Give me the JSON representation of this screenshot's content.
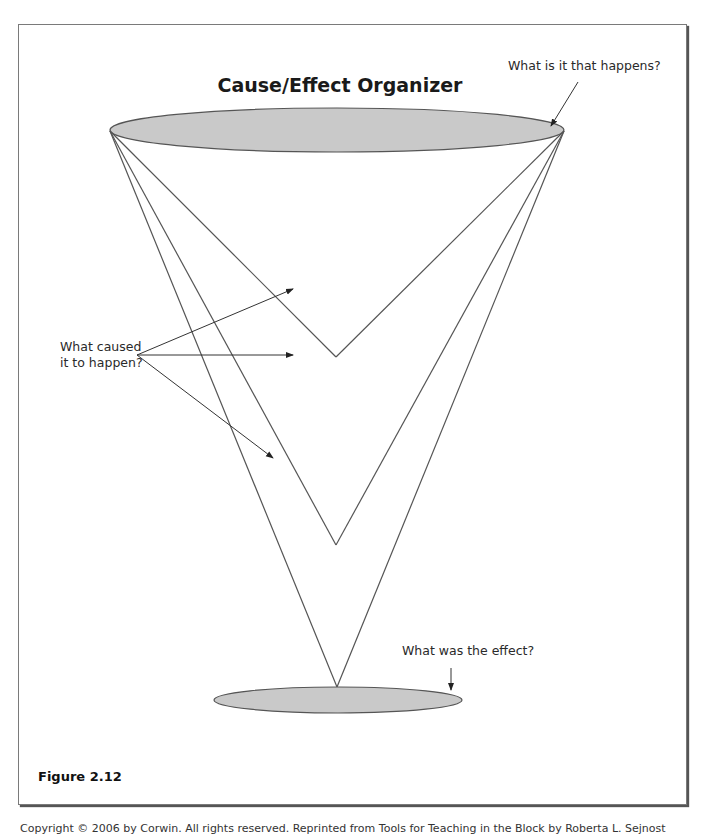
{
  "diagram": {
    "title": "Cause/Effect Organizer",
    "colors": {
      "ellipse_fill": "#c9c9c9",
      "ellipse_stroke": "#555555",
      "line_stroke": "#555555",
      "arrow_stroke": "#333333",
      "frame_border": "#7a7a7a"
    },
    "top_ellipse": {
      "role": "what happens",
      "cx": 337,
      "cy": 130,
      "rx": 227,
      "ry": 22
    },
    "bottom_ellipse": {
      "role": "effect",
      "cx": 338,
      "cy": 700,
      "rx": 124,
      "ry": 13
    },
    "cone_vertices": [
      {
        "x": 336,
        "y": 357
      },
      {
        "x": 336,
        "y": 545
      },
      {
        "x": 337,
        "y": 687
      }
    ],
    "annotations": {
      "top": {
        "text": "What is it that happens?"
      },
      "cause": {
        "line1": "What caused",
        "line2": "it to happen?"
      },
      "effect": {
        "text": "What was the effect?"
      }
    }
  },
  "caption": "Figure 2.12",
  "footer": "Copyright © 2006 by Corwin. All rights reserved. Reprinted from Tools for Teaching in the Block by Roberta L. Sejnost"
}
